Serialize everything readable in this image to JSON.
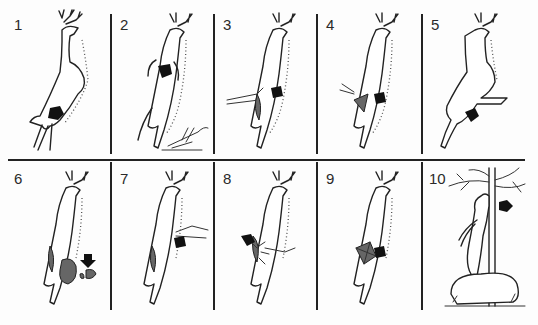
{
  "diagram": {
    "type": "step-by-step illustration grid",
    "layout": {
      "rows": 2,
      "columns": 5
    },
    "line_color": "#222222",
    "arrow_color": "#111111",
    "cavity_fill": "#666666",
    "panels": [
      {
        "number": "1",
        "content": "leaping deer, arrow at rear belly/anus area"
      },
      {
        "number": "2",
        "content": "deer belly-up view, arrow at chest, hand with knife below"
      },
      {
        "number": "3",
        "content": "deer with hand inserted into body cavity, arrow at side"
      },
      {
        "number": "4",
        "content": "deer with opened shaded body cavity, arrow at side"
      },
      {
        "number": "5",
        "content": "side view of deer with leg pulled back, arrow at hindquarter"
      },
      {
        "number": "6",
        "content": "deer with removed organs on ground, arrow pointing at organs"
      },
      {
        "number": "7",
        "content": "deer with hand reaching into chest, arrow at chest"
      },
      {
        "number": "8",
        "content": "deer with opened chest and blood, arrow at chest"
      },
      {
        "number": "9",
        "content": "deer with propped-open cavity, arrow at side"
      },
      {
        "number": "10",
        "content": "deer hung by antlers from tree over rock, arrow at tree"
      }
    ]
  }
}
